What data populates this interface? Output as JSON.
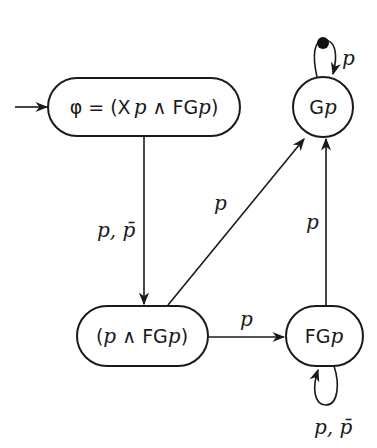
{
  "diagram": {
    "type": "automaton",
    "nodes": [
      {
        "id": "init",
        "label": "φ = (X p ∧ FG p)",
        "parts": {
          "phi": "φ",
          "eq": " = (",
          "X": "X",
          "p1": "p",
          "and": " ∧ ",
          "FG": "FG",
          "p2": "p",
          "close": ")"
        },
        "initial": true
      },
      {
        "id": "mid",
        "label": "(p ∧ FG p)",
        "parts": {
          "open": "(",
          "p1": "p",
          "and": " ∧ ",
          "FG": "FG",
          "p2": "p",
          "close": ")"
        }
      },
      {
        "id": "Gp",
        "label": "G p",
        "parts": {
          "G": "G",
          "p": "p"
        },
        "accepting_marker": "black-dot"
      },
      {
        "id": "FGp",
        "label": "FG p",
        "parts": {
          "FG": "FG",
          "p": "p"
        }
      }
    ],
    "edges": [
      {
        "from": "init",
        "to": "mid",
        "label": "p, p̄"
      },
      {
        "from": "mid",
        "to": "Gp",
        "label": "p"
      },
      {
        "from": "mid",
        "to": "FGp",
        "label": "p"
      },
      {
        "from": "FGp",
        "to": "Gp",
        "label": "p"
      },
      {
        "from": "Gp",
        "to": "Gp",
        "label": "p"
      },
      {
        "from": "FGp",
        "to": "FGp",
        "label": "p, p̄"
      }
    ]
  }
}
